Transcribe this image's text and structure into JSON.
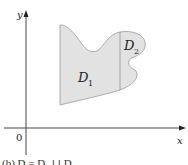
{
  "figure": {
    "axes": {
      "x_label": "x",
      "y_label": "y",
      "origin_label": "0"
    },
    "regions": [
      {
        "name": "D",
        "sub": "1"
      },
      {
        "name": "D",
        "sub": "2"
      }
    ],
    "caption": "(b) D = D₁ ∪ D₂",
    "colors": {
      "region_fill": "#e2e2e2",
      "region_outline": "#9a9a9a",
      "axis": "#333333"
    }
  }
}
